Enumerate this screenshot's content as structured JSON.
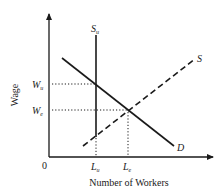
{
  "diagram": {
    "type": "labor-market-supply-demand",
    "y_axis_label": "Wage",
    "x_axis_label": "Number of Workers",
    "origin_label": "0",
    "wage_ticks": [
      {
        "main": "W",
        "sub": "u",
        "y": 84
      },
      {
        "main": "W",
        "sub": "e",
        "y": 110
      }
    ],
    "labor_ticks": [
      {
        "main": "L",
        "sub": "u",
        "x": 96
      },
      {
        "main": "L",
        "sub": "e",
        "x": 128
      }
    ],
    "curves": {
      "union_supply": {
        "main": "S",
        "sub": "u",
        "style": "solid vertical"
      },
      "demand": {
        "label": "D",
        "style": "solid"
      },
      "supply": {
        "label": "S",
        "style": "dashed"
      }
    },
    "colors": {
      "ink": "#1a1a1a",
      "background": "#ffffff"
    }
  }
}
